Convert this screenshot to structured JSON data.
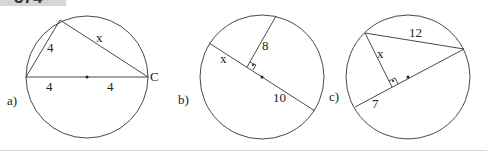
{
  "problem_number": "574",
  "figures": [
    {
      "label": "a)",
      "segment_labels": {
        "chord_left": "4",
        "hypotenuse": "x",
        "diameter_left": "4",
        "diameter_right": "4"
      },
      "point_label": "C"
    },
    {
      "label": "b)",
      "segment_labels": {
        "perpendicular": "8",
        "chord_part": "x",
        "diameter_part": "10"
      }
    },
    {
      "label": "c)",
      "segment_labels": {
        "chord": "12",
        "perpendicular": "x",
        "diameter_part": "7"
      }
    }
  ],
  "colors": {
    "stroke": "#333333",
    "tag_bg": "#d6d6d6"
  }
}
